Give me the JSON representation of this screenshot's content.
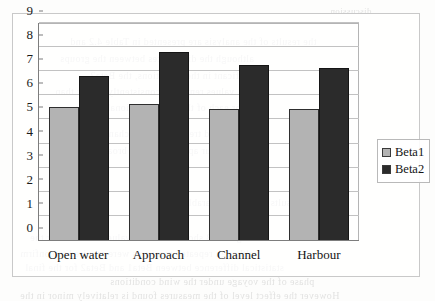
{
  "chart_data": {
    "type": "bar",
    "title": "",
    "xlabel": "",
    "ylabel": "",
    "categories": [
      "Open water",
      "Approach",
      "Channel",
      "Harbour"
    ],
    "series": [
      {
        "name": "Beta1",
        "color": "#b3b3b3",
        "values": [
          5.5,
          5.65,
          5.45,
          5.45
        ]
      },
      {
        "name": "Beta2",
        "color": "#2b2b2b",
        "values": [
          6.8,
          7.8,
          7.25,
          7.15
        ]
      }
    ],
    "ylim": [
      0,
      9
    ],
    "yticks": [
      0,
      1,
      2,
      3,
      4,
      5,
      6,
      7,
      8,
      9
    ],
    "ytick_labels": [
      "0",
      "1",
      "2",
      "3",
      "4",
      "5",
      "6",
      "7",
      "8",
      "9"
    ],
    "grid": true,
    "grid_axis": "y",
    "legend_position": "right"
  },
  "scan_ghost": {
    "note": "faint mirrored bleed-through text from the reverse of the scanned page",
    "lines": [
      {
        "text": "discussion",
        "x": 330,
        "y": 6,
        "size": 9
      },
      {
        "text": "the results of the analysis are presented in Table 4.2 and",
        "x": 70,
        "y": 36,
        "size": 10
      },
      {
        "text": "although the differences between the groups",
        "x": 60,
        "y": 53,
        "size": 10
      },
      {
        "text": "significant in the conditions, the Beta2",
        "x": 90,
        "y": 70,
        "size": 10
      },
      {
        "text": "values remained consistently higher than",
        "x": 55,
        "y": 86,
        "size": 10
      },
      {
        "text": "for each of the four operational phases",
        "x": 75,
        "y": 102,
        "size": 10
      },
      {
        "text": "the observed trend across the channel",
        "x": 95,
        "y": 128,
        "size": 10
      },
      {
        "text": "and harbour approaches was broadly similar",
        "x": 60,
        "y": 145,
        "size": 10
      },
      {
        "text": "tabulated results show a comparable pattern",
        "x": 150,
        "y": 197,
        "size": 10
      },
      {
        "text": "Figure 4.3 shows the mean values obtained for the",
        "x": 30,
        "y": 232,
        "size": 10
      },
      {
        "text": "although repeated measures were required to confirm",
        "x": 20,
        "y": 248,
        "size": 10
      },
      {
        "text": "statistical difference between Beta1 and Beta2 for the final",
        "x": 25,
        "y": 262,
        "size": 10
      },
      {
        "text": "phase of the voyage under the wind conditions",
        "x": 110,
        "y": 276,
        "size": 10
      },
      {
        "text": "However the effect level of the measures found is relatively minor in the",
        "x": 20,
        "y": 290,
        "size": 10
      }
    ]
  }
}
